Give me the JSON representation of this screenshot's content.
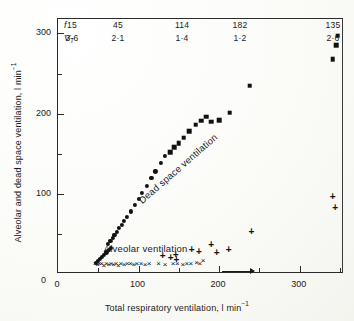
{
  "figure": {
    "header_table": {
      "row_labels": {
        "frequency": "f",
        "tidal_volume_main": "V",
        "tidal_volume_sub": "T"
      },
      "columns": [
        {
          "f": "15",
          "vt": "3·6",
          "x": 72
        },
        {
          "f": "45",
          "vt": "2·1",
          "x": 118
        },
        {
          "f": "114",
          "vt": "1·4",
          "x": 182
        },
        {
          "f": "182",
          "vt": "1·2",
          "x": 240
        },
        {
          "f": "135",
          "vt": "2·6",
          "x": 333
        }
      ]
    },
    "labels": {
      "dead_space": "Dead space ventilation",
      "alveolar": "Alveolar ventilation"
    },
    "annotations": {
      "arrow": "rightward-arrow"
    }
  },
  "chart_data": {
    "type": "scatter",
    "title": "",
    "xlabel": "Total respiratory ventilation,  l min",
    "xlabel_exponent": "−1",
    "ylabel": "Alveolar and dead space ventilation,  l min",
    "ylabel_exponent": "−1",
    "xlim": [
      0,
      355
    ],
    "ylim": [
      0,
      318
    ],
    "xticks": [
      0,
      100,
      200,
      300
    ],
    "yticks": [
      0,
      100,
      200,
      300
    ],
    "xticks_minor": [
      50,
      150,
      250,
      350
    ],
    "yticks_minor": [
      50,
      150,
      250
    ],
    "grid": false,
    "legend": "in-plot text labels",
    "series": [
      {
        "name": "Dead space ventilation",
        "marker": "ci",
        "points": [
          [
            47,
            14
          ],
          [
            50,
            16
          ],
          [
            52,
            19
          ],
          [
            55,
            21
          ],
          [
            57,
            24
          ],
          [
            60,
            27
          ],
          [
            63,
            30
          ],
          [
            66,
            33
          ],
          [
            62,
            38
          ],
          [
            65,
            41
          ],
          [
            68,
            45
          ],
          [
            70,
            49
          ],
          [
            73,
            53
          ],
          [
            76,
            57
          ],
          [
            79,
            61
          ],
          [
            82,
            66
          ],
          [
            86,
            71
          ],
          [
            90,
            78
          ],
          [
            95,
            86
          ],
          [
            100,
            94
          ],
          [
            104,
            101
          ],
          [
            110,
            110
          ],
          [
            116,
            120
          ],
          [
            121,
            128
          ],
          [
            128,
            139
          ],
          [
            133,
            147
          ]
        ]
      },
      {
        "name": "Dead space ventilation (high range)",
        "marker": "sq",
        "points": [
          [
            139,
            152
          ],
          [
            144,
            158
          ],
          [
            150,
            163
          ],
          [
            156,
            170
          ],
          [
            163,
            178
          ],
          [
            171,
            186
          ],
          [
            178,
            191
          ],
          [
            184,
            196
          ],
          [
            190,
            190
          ],
          [
            200,
            192
          ],
          [
            213,
            201
          ],
          [
            238,
            235
          ],
          [
            341,
            268
          ],
          [
            345,
            285
          ],
          [
            347,
            297
          ]
        ]
      },
      {
        "name": "Alveolar ventilation (low range)",
        "marker": "cross",
        "points": [
          [
            46,
            12
          ],
          [
            49,
            11
          ],
          [
            51,
            13
          ],
          [
            54,
            12
          ],
          [
            57,
            10
          ],
          [
            60,
            12
          ],
          [
            63,
            11
          ],
          [
            66,
            13
          ],
          [
            69,
            11
          ],
          [
            72,
            12
          ],
          [
            75,
            10
          ],
          [
            78,
            12
          ],
          [
            82,
            11
          ],
          [
            86,
            13
          ],
          [
            90,
            12
          ],
          [
            94,
            11
          ],
          [
            98,
            13
          ],
          [
            103,
            12
          ],
          [
            108,
            11
          ],
          [
            113,
            13
          ],
          [
            125,
            12
          ],
          [
            133,
            11
          ],
          [
            143,
            13
          ],
          [
            148,
            12
          ],
          [
            155,
            11
          ],
          [
            160,
            13
          ],
          [
            165,
            12
          ],
          [
            172,
            14
          ],
          [
            176,
            12
          ],
          [
            180,
            16
          ]
        ]
      },
      {
        "name": "Alveolar ventilation (upper points)",
        "marker": "plus",
        "points": [
          [
            130,
            22
          ],
          [
            140,
            20
          ],
          [
            146,
            24
          ],
          [
            147,
            17
          ],
          [
            166,
            30
          ],
          [
            175,
            27
          ],
          [
            190,
            36
          ],
          [
            197,
            26
          ],
          [
            212,
            30
          ],
          [
            240,
            52
          ],
          [
            341,
            96
          ],
          [
            344,
            82
          ]
        ]
      }
    ]
  }
}
